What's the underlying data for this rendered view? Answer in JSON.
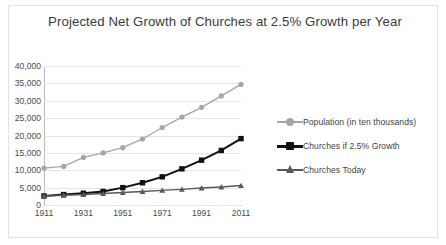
{
  "chart_data": {
    "type": "line",
    "title": "Projected Net Growth of Churches at 2.5% Growth per Year",
    "xlabel": "",
    "ylabel": "",
    "x": [
      1911,
      1921,
      1931,
      1941,
      1951,
      1961,
      1971,
      1981,
      1991,
      2001,
      2011
    ],
    "xtick_labels": [
      "1911",
      "1931",
      "1951",
      "1971",
      "1991",
      "2011"
    ],
    "xticks": [
      1911,
      1931,
      1951,
      1971,
      1991,
      2011
    ],
    "ytick_labels": [
      "0",
      "5,000",
      "10,000",
      "15,000",
      "20,000",
      "25,000",
      "30,000",
      "35,000",
      "40,000"
    ],
    "yticks": [
      0,
      5000,
      10000,
      15000,
      20000,
      25000,
      30000,
      35000,
      40000
    ],
    "ylim": [
      0,
      40000
    ],
    "xlim": [
      1911,
      2011
    ],
    "grid": true,
    "legend_position": "right",
    "series": [
      {
        "name": "Population (in ten thousands)",
        "color": "#a6a6a6",
        "marker": "circle",
        "values": [
          10600,
          11100,
          13700,
          15000,
          16500,
          19000,
          22300,
          25300,
          28100,
          31400,
          34700
        ]
      },
      {
        "name": "Churches if 2.5% Growth",
        "color": "#111111",
        "marker": "square",
        "values": [
          2600,
          3000,
          3400,
          3900,
          5000,
          6400,
          8100,
          10400,
          12900,
          15700,
          19100
        ]
      },
      {
        "name": "Churches Today",
        "color": "#595959",
        "marker": "triangle",
        "values": [
          2600,
          2800,
          3000,
          3300,
          3600,
          3900,
          4200,
          4500,
          4900,
          5200,
          5600
        ]
      }
    ]
  }
}
